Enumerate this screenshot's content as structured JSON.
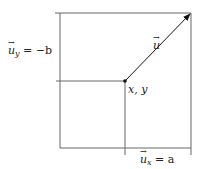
{
  "diagram": {
    "labels": {
      "uy": "u⃗ᵧ = −b",
      "uy_base": "u",
      "uy_sub": "y",
      "uy_rhs": " = −b",
      "ux_base": "u",
      "ux_sub": "x",
      "ux_rhs": " = a",
      "u": "u",
      "point": "x, y"
    },
    "colors": {
      "line": "#555555",
      "arrow": "#111111"
    }
  }
}
